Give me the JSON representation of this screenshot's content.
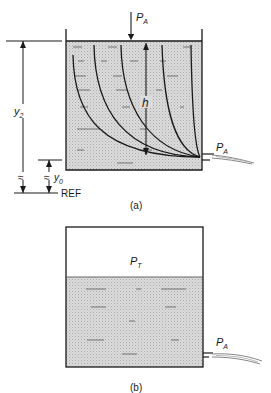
{
  "figure": {
    "panel_a": {
      "caption": "(a)",
      "labels": {
        "top_pressure": "P",
        "top_pressure_sub": "A",
        "outlet_pressure": "P",
        "outlet_pressure_sub": "A",
        "head": "h",
        "height_total": "y",
        "height_total_sub": "2",
        "height_outlet": "y",
        "height_outlet_sub": "0",
        "reference": "REF",
        "break_symbol": "≈"
      }
    },
    "panel_b": {
      "caption": "(b)",
      "labels": {
        "tank_pressure": "P",
        "tank_pressure_sub": "T",
        "outlet_pressure": "P",
        "outlet_pressure_sub": "A"
      }
    },
    "colors": {
      "line": "#1a1a1a",
      "fluid_fill": "#d6d6d6",
      "fluid_dash": "#7a7a7a",
      "background": "#ffffff"
    }
  }
}
